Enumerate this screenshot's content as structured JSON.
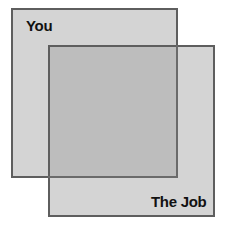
{
  "diagram": {
    "type": "overlapping-squares",
    "shapes": [
      {
        "id": "you",
        "label": "You",
        "fill": "#d4d4d4",
        "border": "#5e5e5e"
      },
      {
        "id": "the-job",
        "label": "The Job",
        "fill": "#d4d4d4",
        "border": "#5e5e5e"
      }
    ],
    "overlap_fill": "#bdbdbd"
  }
}
